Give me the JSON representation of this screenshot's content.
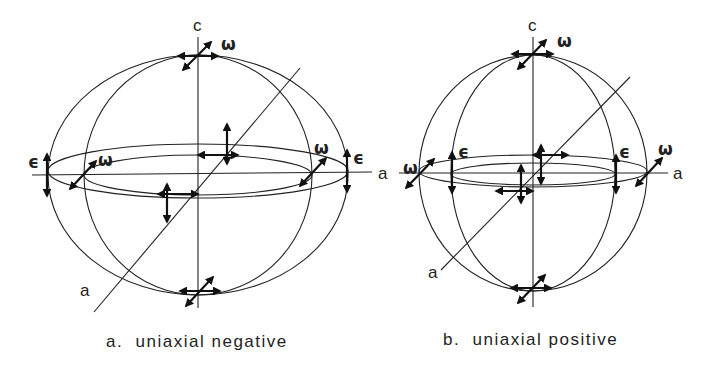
{
  "diagrams": [
    {
      "id": "a",
      "caption": "a.  uniaxial negative",
      "axis_labels": {
        "c": "c",
        "a_horizontal": "a",
        "a_diagonal": "a"
      },
      "ray_labels": {
        "omega": "ω",
        "epsilon": "ϵ"
      }
    },
    {
      "id": "b",
      "caption": "b.  uniaxial positive",
      "axis_labels": {
        "c": "c",
        "a_horizontal": "a",
        "a_diagonal": "a"
      },
      "ray_labels": {
        "omega": "ω",
        "epsilon": "ϵ"
      }
    }
  ]
}
